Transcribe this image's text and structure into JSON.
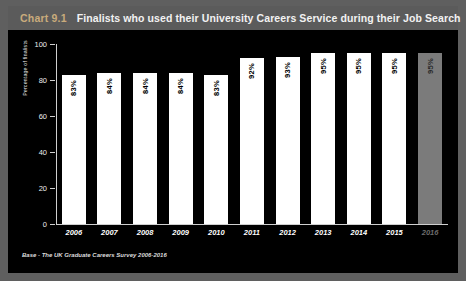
{
  "header": {
    "chart_number": "Chart 9.1",
    "title": "Finalists who used their University Careers Service during their Job Search"
  },
  "footer": {
    "base_note": "Base - The UK Graduate Careers Survey 2006-2016"
  },
  "colors": {
    "panel_background": "#000000",
    "title_band": "#5b5b5b",
    "page_background": "#5f5f5f",
    "chart_number": "#c9ab7c",
    "bar": "#ffffff",
    "bar_projected": "#7b7b7b",
    "axis": "#cfcfcf"
  },
  "chart_data": {
    "type": "bar",
    "title": "Finalists who used their University Careers Service during their Job Search",
    "xlabel": "",
    "ylabel": "Percentage of finalists",
    "ylim": [
      0,
      100
    ],
    "yticks": [
      0,
      20,
      40,
      60,
      80,
      100
    ],
    "grid": false,
    "legend": "none",
    "value_suffix": "%",
    "categories": [
      "2006",
      "2007",
      "2008",
      "2009",
      "2010",
      "2011",
      "2012",
      "2013",
      "2014",
      "2015",
      "2016"
    ],
    "values": [
      83,
      84,
      84,
      84,
      83,
      92,
      93,
      95,
      95,
      95,
      95
    ],
    "value_labels": [
      "83%",
      "84%",
      "84%",
      "84%",
      "83%",
      "92%",
      "93%",
      "95%",
      "95%",
      "95%",
      "95%"
    ],
    "projected_index": 10
  }
}
